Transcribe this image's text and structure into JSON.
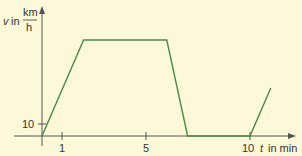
{
  "chart_data": {
    "type": "line",
    "title": "",
    "xlabel": "t in min",
    "ylabel": "v in km/h",
    "ylabel_parts": {
      "var": "v",
      "in": "in",
      "num": "km",
      "den": "h"
    },
    "xlabel_parts": {
      "var": "t",
      "rest": "in min"
    },
    "x_ticks": [
      1,
      5,
      10
    ],
    "x_tick_labels": [
      "1",
      "5",
      "10"
    ],
    "y_ticks": [
      10
    ],
    "y_tick_labels": [
      "10"
    ],
    "xlim": [
      -0.4,
      12.6
    ],
    "ylim": [
      -1,
      85
    ],
    "grid": false,
    "legend": null,
    "series": [
      {
        "name": "velocity",
        "color": "#4a8a4a",
        "x": [
          0,
          2,
          6,
          7,
          10,
          11
        ],
        "y": [
          0,
          80,
          80,
          0,
          0,
          40
        ]
      }
    ]
  },
  "colors": {
    "background": "#fdf9d8",
    "line": "#4a8a4a",
    "axis": "#555555"
  }
}
